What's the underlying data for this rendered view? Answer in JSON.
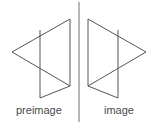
{
  "diagram": {
    "type": "geometric-reflection",
    "title": "",
    "canvas": {
      "width": 159,
      "height": 125
    },
    "background_color": "#ffffff",
    "stroke_color": "#555555",
    "stroke_width": 1,
    "mirror_line": {
      "name": "line-of-reflection",
      "x": 79,
      "y1": 2,
      "y2": 122,
      "color": "#888888"
    },
    "labels": {
      "preimage": "preimage",
      "image": "image",
      "color": "#4a4a4a",
      "font_size_px": 11
    },
    "shapes": [
      {
        "name": "preimage-shape",
        "label": "preimage",
        "paths": [
          {
            "name": "upper-triangle",
            "points": "70,19 12,52 70,86"
          },
          {
            "name": "lower-triangle",
            "points": "40,30 40,98 70,86"
          },
          {
            "name": "right-edge",
            "points": "70,19 70,86"
          }
        ]
      },
      {
        "name": "image-shape",
        "label": "image",
        "paths": [
          {
            "name": "upper-triangle",
            "points": "88,19 146,52 88,86"
          },
          {
            "name": "lower-triangle",
            "points": "118,30 118,98 88,86"
          },
          {
            "name": "left-edge",
            "points": "88,19 88,86"
          }
        ]
      }
    ]
  }
}
